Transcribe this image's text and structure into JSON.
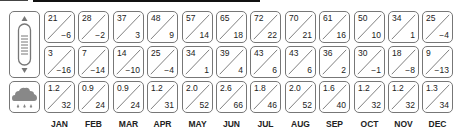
{
  "icons": {
    "temperature": "thermometer-icon",
    "precipitation": "rain-cloud-icon"
  },
  "months": [
    "JAN",
    "FEB",
    "MAR",
    "APR",
    "MAY",
    "JUN",
    "JUL",
    "AUG",
    "SEP",
    "OCT",
    "NOV",
    "DEC"
  ],
  "rows": {
    "temp_high": {
      "label": "Temperature row 1",
      "top": [
        "21",
        "28",
        "37",
        "48",
        "57",
        "65",
        "72",
        "70",
        "61",
        "50",
        "34",
        "25"
      ],
      "bottom": [
        "−6",
        "−2",
        "3",
        "9",
        "14",
        "18",
        "22",
        "21",
        "16",
        "10",
        "1",
        "−4"
      ]
    },
    "temp_low": {
      "label": "Temperature row 2",
      "top": [
        "3",
        "7",
        "14",
        "25",
        "34",
        "39",
        "43",
        "43",
        "36",
        "30",
        "18",
        "9"
      ],
      "bottom": [
        "−16",
        "−14",
        "−10",
        "−4",
        "1",
        "4",
        "6",
        "6",
        "2",
        "−1",
        "−8",
        "−13"
      ]
    },
    "precip": {
      "label": "Precipitation row",
      "top": [
        "1.2",
        "0.9",
        "0.9",
        "1.2",
        "2.0",
        "2.6",
        "1.8",
        "2.0",
        "1.6",
        "1.2",
        "1.2",
        "1.3"
      ],
      "bottom": [
        "32",
        "24",
        "24",
        "31",
        "52",
        "66",
        "46",
        "52",
        "40",
        "32",
        "32",
        "34"
      ]
    }
  }
}
